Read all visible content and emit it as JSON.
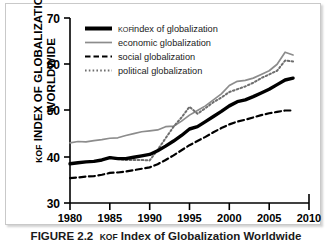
{
  "figure": {
    "caption_number": "FIGURE 2.2",
    "caption_text": "KOF Index of Globalization Worldwide",
    "caption_small_caps": "KOF",
    "caption_rest": " Index of Globalization Worldwide"
  },
  "axis": {
    "y_title_line1": "KOF INDEX OF",
    "y_title_line2": "GLOBALIZATION WORLDWIDE",
    "y_title_small_caps": "KOF",
    "y_title_rest": " INDEX OF GLOBALIZATION WORLDWIDE"
  },
  "colors": {
    "kof": "#000000",
    "economic": "#8c8c8c",
    "social": "#000000",
    "political": "#6e6e6e",
    "axis": "#000000",
    "frame": "#c9c9c9",
    "background": "#ffffff"
  },
  "chart_data": {
    "type": "line",
    "title": "",
    "xlabel": "",
    "ylabel": "KOF INDEX OF GLOBALIZATION WORLDWIDE",
    "xlim": [
      1980,
      2010
    ],
    "ylim": [
      30,
      70
    ],
    "xticks": [
      1980,
      1985,
      1990,
      1995,
      2000,
      2005,
      2010
    ],
    "yticks": [
      30,
      40,
      50,
      60,
      70
    ],
    "grid": false,
    "legend_position": "top-left",
    "x": [
      1980,
      1981,
      1982,
      1983,
      1984,
      1985,
      1986,
      1987,
      1988,
      1989,
      1990,
      1991,
      1992,
      1993,
      1994,
      1995,
      1996,
      1997,
      1998,
      1999,
      2000,
      2001,
      2002,
      2003,
      2004,
      2005,
      2006,
      2007,
      2008
    ],
    "series": [
      {
        "name": "KOF index of globalization",
        "legend_label": "KOF index of globalization",
        "legend_small_caps": "KOF",
        "legend_rest": " index of globalization",
        "style": "solid-thick",
        "color": "#000000",
        "values": [
          38.5,
          38.7,
          38.9,
          39.0,
          39.3,
          39.8,
          39.6,
          39.6,
          39.9,
          40.2,
          40.5,
          41.3,
          42.3,
          43.4,
          44.6,
          46.0,
          46.5,
          47.6,
          48.7,
          49.8,
          51.0,
          51.9,
          52.3,
          53.0,
          53.8,
          54.6,
          55.6,
          56.6,
          57.0
        ]
      },
      {
        "name": "economic globalization",
        "legend_label": "economic globalization",
        "style": "solid-thin",
        "color": "#8c8c8c",
        "values": [
          43.0,
          43.3,
          43.2,
          43.5,
          43.7,
          44.0,
          44.1,
          44.6,
          45.0,
          45.4,
          45.6,
          45.8,
          46.5,
          46.6,
          47.7,
          49.0,
          50.0,
          51.0,
          52.3,
          53.6,
          55.4,
          56.3,
          56.5,
          57.0,
          57.8,
          58.6,
          60.0,
          62.6,
          62.0
        ]
      },
      {
        "name": "social globalization",
        "legend_label": "social globalization",
        "style": "dashed",
        "color": "#000000",
        "values": [
          35.4,
          35.5,
          35.7,
          35.8,
          36.1,
          36.5,
          36.6,
          36.8,
          37.1,
          37.4,
          37.7,
          38.4,
          39.3,
          40.3,
          41.4,
          42.5,
          43.4,
          44.3,
          45.3,
          46.2,
          47.0,
          47.6,
          48.0,
          48.5,
          49.0,
          49.4,
          49.7,
          50.0,
          50.0
        ]
      },
      {
        "name": "political globalization",
        "legend_label": "political globalization",
        "style": "dotted",
        "color": "#6e6e6e",
        "values": [
          null,
          null,
          null,
          null,
          null,
          39.9,
          39.5,
          39.3,
          39.3,
          39.3,
          39.2,
          41.5,
          44.0,
          46.5,
          48.5,
          50.8,
          49.3,
          50.5,
          51.8,
          52.8,
          54.0,
          54.6,
          55.2,
          56.0,
          57.0,
          57.8,
          58.6,
          60.8,
          60.6
        ]
      }
    ]
  }
}
